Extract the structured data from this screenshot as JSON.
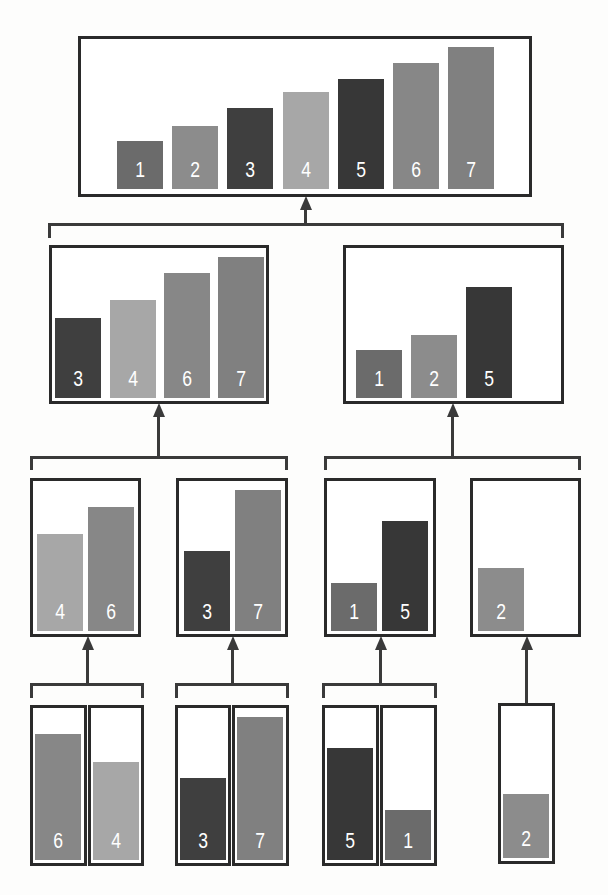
{
  "diagram": {
    "title": "",
    "kind": "merge-sort-tree",
    "colors": {
      "1": "#6b6b6b",
      "2": "#8c8c8c",
      "3": "#3f3f3f",
      "4": "#a7a7a7",
      "5": "#373737",
      "6": "#878787",
      "7": "#808080",
      "border": "#2a2a2a",
      "connector": "#3a3a3a",
      "label": "#ffffff"
    },
    "nodes": [
      {
        "id": "root",
        "level": 0,
        "values": [
          1,
          2,
          3,
          4,
          5,
          6,
          7
        ],
        "box": [
          78,
          36,
          532,
          197
        ]
      },
      {
        "id": "left",
        "level": 1,
        "values": [
          3,
          4,
          6,
          7
        ],
        "box": [
          49,
          245,
          269,
          404
        ]
      },
      {
        "id": "right",
        "level": 1,
        "values": [
          1,
          2,
          5
        ],
        "box": [
          343,
          245,
          564,
          404
        ]
      },
      {
        "id": "ll",
        "level": 2,
        "values": [
          4,
          6
        ],
        "box": [
          30,
          478,
          141,
          637
        ]
      },
      {
        "id": "lr",
        "level": 2,
        "values": [
          3,
          7
        ],
        "box": [
          176,
          478,
          288,
          637
        ]
      },
      {
        "id": "rl",
        "level": 2,
        "values": [
          1,
          5
        ],
        "box": [
          324,
          478,
          436,
          637
        ]
      },
      {
        "id": "rr",
        "level": 2,
        "values": [
          2
        ],
        "box": [
          470,
          478,
          581,
          637
        ]
      },
      {
        "id": "lll",
        "level": 3,
        "values": [
          6
        ],
        "box": [
          30,
          705,
          87,
          866
        ]
      },
      {
        "id": "llr",
        "level": 3,
        "values": [
          4
        ],
        "box": [
          88,
          705,
          144,
          866
        ]
      },
      {
        "id": "lrl",
        "level": 3,
        "values": [
          3
        ],
        "box": [
          175,
          705,
          231,
          866
        ]
      },
      {
        "id": "lrr",
        "level": 3,
        "values": [
          7
        ],
        "box": [
          232,
          705,
          289,
          866
        ]
      },
      {
        "id": "rll",
        "level": 3,
        "values": [
          5
        ],
        "box": [
          322,
          705,
          379,
          866
        ]
      },
      {
        "id": "rlr",
        "level": 3,
        "values": [
          1
        ],
        "box": [
          380,
          705,
          437,
          866
        ]
      },
      {
        "id": "rrl",
        "level": 3,
        "values": [
          2
        ],
        "box": [
          498,
          703,
          555,
          864
        ]
      }
    ],
    "connectors": [
      {
        "from": [
          "left",
          "right"
        ],
        "to": "root",
        "bracket": [
          48,
          223,
          564,
          238
        ],
        "stem_x": 305,
        "stem_top": 197
      },
      {
        "from": [
          "ll",
          "lr"
        ],
        "to": "left",
        "bracket": [
          30,
          456,
          288,
          470
        ],
        "stem_x": 158,
        "stem_top": 404
      },
      {
        "from": [
          "rl",
          "rr"
        ],
        "to": "right",
        "bracket": [
          324,
          456,
          581,
          470
        ],
        "stem_x": 452,
        "stem_top": 404
      },
      {
        "from": [
          "lll",
          "llr"
        ],
        "to": "ll",
        "bracket": [
          30,
          683,
          144,
          698
        ],
        "stem_x": 87,
        "stem_top": 637
      },
      {
        "from": [
          "lrl",
          "lrr"
        ],
        "to": "lr",
        "bracket": [
          175,
          683,
          289,
          698
        ],
        "stem_x": 232,
        "stem_top": 637
      },
      {
        "from": [
          "rll",
          "rlr"
        ],
        "to": "rl",
        "bracket": [
          322,
          683,
          437,
          698
        ],
        "stem_x": 380,
        "stem_top": 637
      },
      {
        "from": [
          "rrl"
        ],
        "to": "rr",
        "bracket": null,
        "stem_x": 526,
        "stem_top": 637,
        "stem_bottom": 703
      }
    ],
    "bar_geometry": {
      "root": {
        "x": [
          117,
          172,
          227,
          283,
          338,
          393,
          448
        ],
        "width": 46,
        "bottom": 189,
        "tops": [
          141,
          126,
          108,
          92,
          79,
          63,
          47
        ]
      },
      "left": {
        "x": [
          55,
          110,
          164,
          218
        ],
        "width": 46,
        "bottom": 398,
        "tops": [
          318,
          300,
          273,
          257
        ]
      },
      "right": {
        "x": [
          356,
          411,
          466
        ],
        "width": 46,
        "bottom": 398,
        "tops": [
          350,
          335,
          287
        ]
      },
      "ll": {
        "x": [
          37,
          88
        ],
        "width": 46,
        "bottom": 631,
        "tops": [
          534,
          507
        ]
      },
      "lr": {
        "x": [
          184,
          235
        ],
        "width": 46,
        "bottom": 631,
        "tops": [
          551,
          490
        ]
      },
      "rl": {
        "x": [
          331,
          382
        ],
        "width": 46,
        "bottom": 631,
        "tops": [
          583,
          521
        ]
      },
      "rr": {
        "x": [
          478
        ],
        "width": 46,
        "bottom": 631,
        "tops": [
          568
        ]
      },
      "lll": {
        "x": [
          35
        ],
        "width": 46,
        "bottom": 860,
        "tops": [
          734
        ]
      },
      "llr": {
        "x": [
          93
        ],
        "width": 46,
        "bottom": 860,
        "tops": [
          762
        ]
      },
      "lrl": {
        "x": [
          180
        ],
        "width": 46,
        "bottom": 860,
        "tops": [
          778
        ]
      },
      "lrr": {
        "x": [
          237
        ],
        "width": 46,
        "bottom": 860,
        "tops": [
          717
        ]
      },
      "rll": {
        "x": [
          327
        ],
        "width": 46,
        "bottom": 860,
        "tops": [
          748
        ]
      },
      "rlr": {
        "x": [
          385
        ],
        "width": 46,
        "bottom": 860,
        "tops": [
          810
        ]
      },
      "rrl": {
        "x": [
          503
        ],
        "width": 46,
        "bottom": 858,
        "tops": [
          794
        ]
      }
    }
  }
}
